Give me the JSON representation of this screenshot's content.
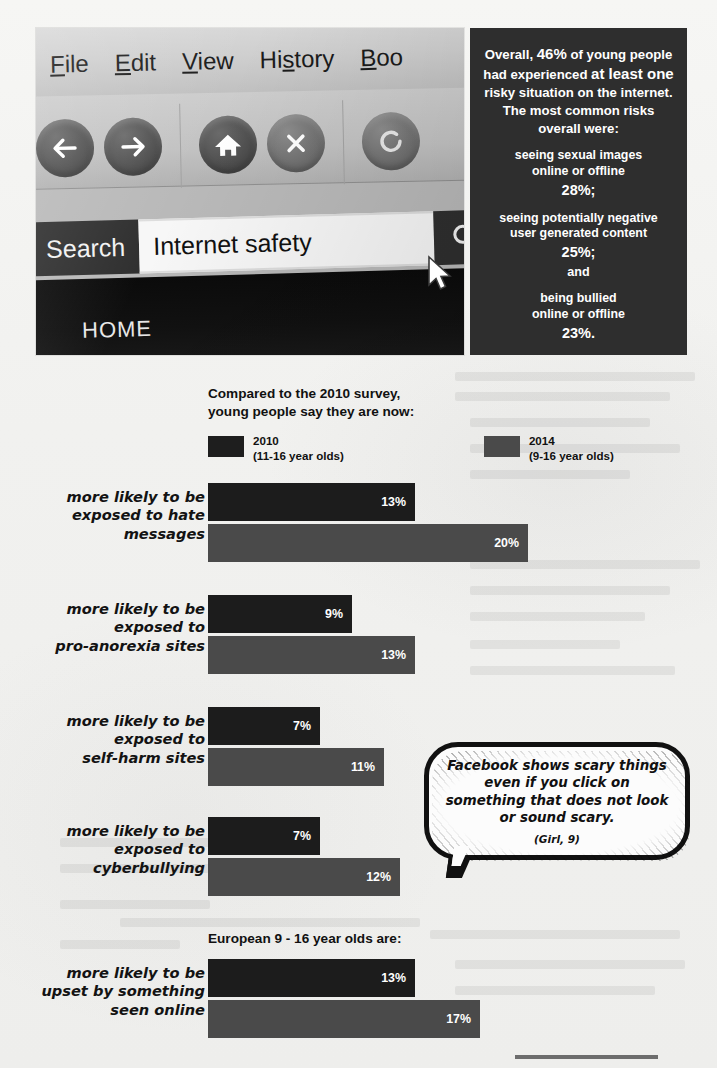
{
  "browser_photo": {
    "menus": [
      "File",
      "Edit",
      "View",
      "History",
      "Boo"
    ],
    "nav_icons": [
      "back-arrow-icon",
      "forward-arrow-icon",
      "home-icon",
      "stop-icon",
      "reload-icon"
    ],
    "search_label": "Search",
    "search_value": "Internet safety",
    "search_placeholder": "Search",
    "search_button_icon": "magnifier-icon",
    "home_tab": "HOME",
    "cursor_icon": "mouse-pointer-icon"
  },
  "stat_panel": {
    "lead_part1": "Overall, ",
    "lead_pct": "46%",
    "lead_part2": " of young people had experienced ",
    "lead_emph1": "at least one",
    "lead_part3": " risky situation on the internet.  The most common risks overall were:",
    "risks": [
      {
        "text": "seeing sexual images\nonline or offline",
        "pct": "28%;"
      },
      {
        "text": "seeing potentially negative\nuser generated content",
        "pct": "25%;"
      },
      {
        "text": "being bullied\nonline or offline",
        "pct": "23%."
      }
    ],
    "conjunction": "and",
    "bg_color": "#2e2e2e",
    "text_color": "#ffffff"
  },
  "chart_data": {
    "type": "bar",
    "title": "Compared to the 2010 survey,\nyoung people say they are now:",
    "orientation": "horizontal",
    "xlabel": "",
    "ylabel": "",
    "grid": false,
    "legend_position": "top",
    "legend": [
      {
        "name": "2010",
        "sub": "(11-16 year olds)",
        "color": "#1e1e1e"
      },
      {
        "name": "2014",
        "sub": "(9-16 year olds)",
        "color": "#4a4a4a"
      }
    ],
    "categories": [
      "more likely to be\nexposed to hate\nmessages",
      "more likely to be\nexposed to\npro-anorexia sites",
      "more likely to be\nexposed to\nself-harm sites",
      "more likely to be\nexposed to\ncyberbullying"
    ],
    "series": [
      {
        "name": "2010",
        "values": [
          13,
          9,
          7,
          7
        ],
        "labels": [
          "13%",
          "9%",
          "7%",
          "7%"
        ]
      },
      {
        "name": "2014",
        "values": [
          20,
          13,
          11,
          12
        ],
        "labels": [
          "20%",
          "13%",
          "11%",
          "12%"
        ]
      }
    ],
    "xlim": [
      0,
      22
    ],
    "unit": "%"
  },
  "chart_data_secondary": {
    "type": "bar",
    "title": "European 9 - 16 year olds are:",
    "orientation": "horizontal",
    "grid": false,
    "categories": [
      "more likely to be\nupset by something\nseen online"
    ],
    "series": [
      {
        "name": "2010",
        "values": [
          13
        ],
        "labels": [
          "13%"
        ]
      },
      {
        "name": "2014",
        "values": [
          17
        ],
        "labels": [
          "17%"
        ]
      }
    ],
    "xlim": [
      0,
      22
    ],
    "unit": "%"
  },
  "quote": {
    "text": "Facebook shows scary things even if you click on something that does not look or sound scary.",
    "attribution": "(Girl, 9)"
  },
  "colors": {
    "bar_2010": "#1c1c1c",
    "bar_2014": "#4a4a4a",
    "panel_bg": "#2e2e2e",
    "page_bg": "#f3f3f1",
    "footer_rule": "#6d6d6d"
  }
}
